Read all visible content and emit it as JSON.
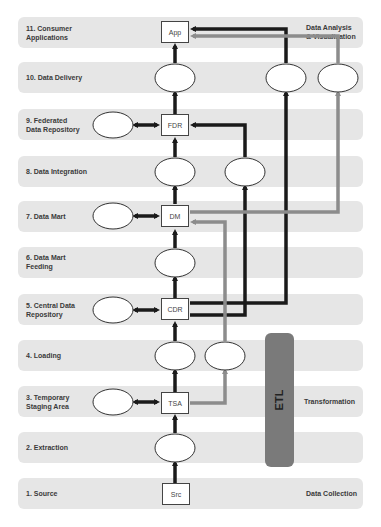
{
  "layers": [
    {
      "id": 11,
      "label_line1": "11. Consumer",
      "label_line2": "Applications",
      "top": 17
    },
    {
      "id": 10,
      "label_line1": "10.  Data Delivery",
      "label_line2": "",
      "top": 62
    },
    {
      "id": 9,
      "label_line1": "9. Federated",
      "label_line2": "Data Repository",
      "top": 109
    },
    {
      "id": 8,
      "label_line1": "8. Data Integration",
      "label_line2": "",
      "top": 156
    },
    {
      "id": 7,
      "label_line1": "7. Data Mart",
      "label_line2": "",
      "top": 201
    },
    {
      "id": 6,
      "label_line1": "6. Data Mart",
      "label_line2": "Feeding",
      "top": 247
    },
    {
      "id": 5,
      "label_line1": "5. Central Data",
      "label_line2": "Repository",
      "top": 294
    },
    {
      "id": 4,
      "label_line1": "4. Loading",
      "label_line2": "",
      "top": 340
    },
    {
      "id": 3,
      "label_line1": "3. Temporary",
      "label_line2": "Staging Area",
      "top": 386
    },
    {
      "id": 2,
      "label_line1": "2. Extraction",
      "label_line2": "",
      "top": 432
    },
    {
      "id": 1,
      "label_line1": "1. Source",
      "label_line2": "",
      "top": 478
    }
  ],
  "nodes": {
    "app": "App",
    "fdr": "FDR",
    "dm": "DM",
    "cdr": "CDR",
    "tsa": "TSA",
    "src": "Src"
  },
  "phases": {
    "analysis_line1": "Data Analysis",
    "analysis_line2": "& Visualization",
    "transformation": "Transformation",
    "collection": "Data Collection",
    "etl": "ETL"
  },
  "colors": {
    "band": "#e6e6e6",
    "dark_arrow": "#1a1a1a",
    "gray_arrow": "#8c8c8c",
    "etl": "#7a7a7a"
  }
}
